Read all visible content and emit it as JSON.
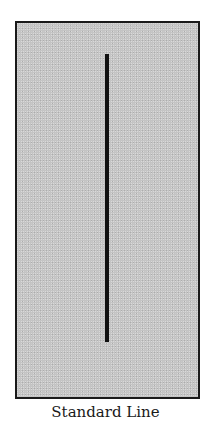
{
  "figure": {
    "caption": "Standard Line",
    "panel_color": "#c4c4c4",
    "line_color": "#111111",
    "border_color": "#1a1a1a"
  }
}
